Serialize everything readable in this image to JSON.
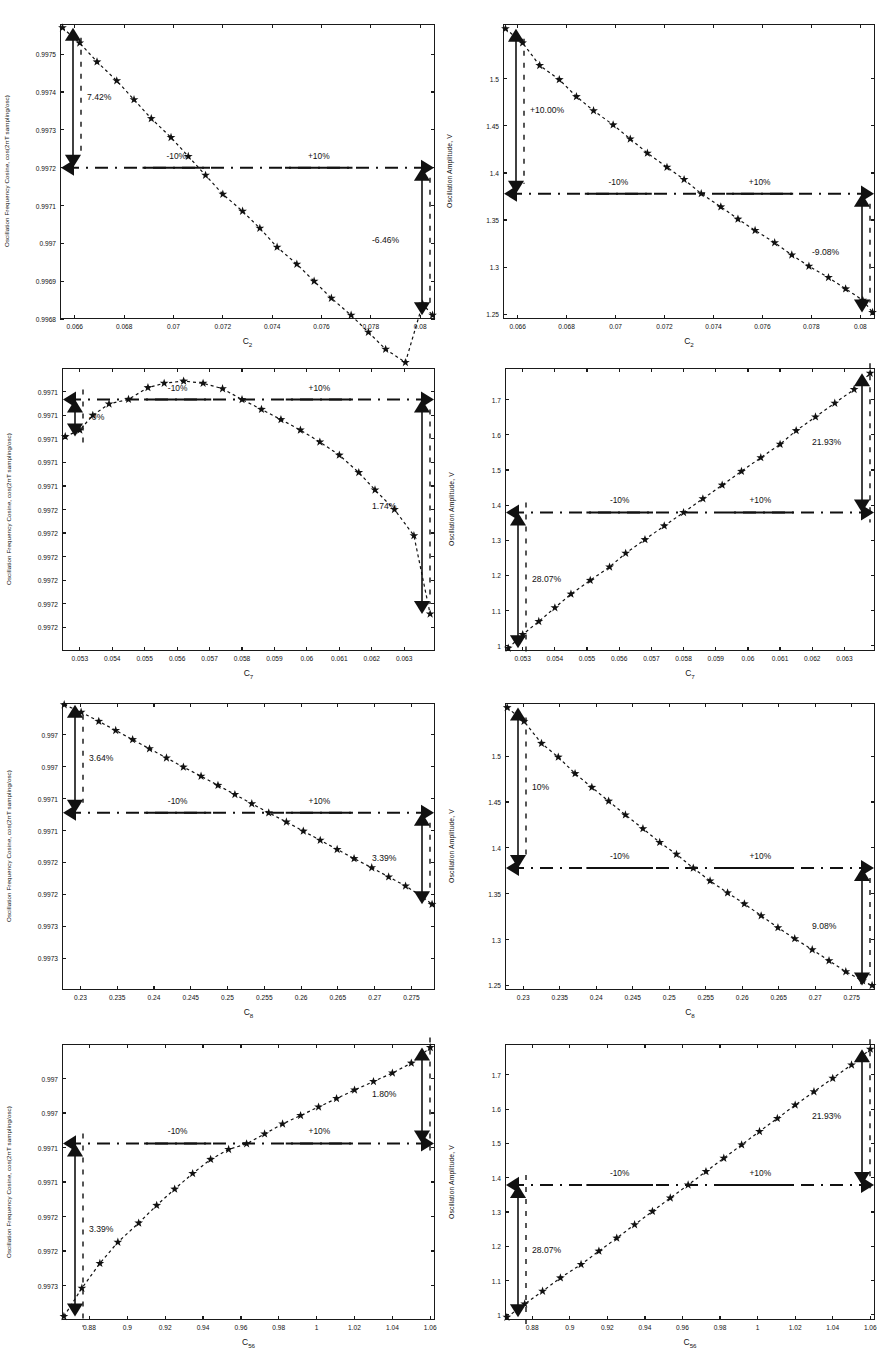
{
  "figure": {
    "columns": 2,
    "rows": 4,
    "marker": "star",
    "line_style": "dashed",
    "reference_line_style": "dash-dot",
    "colors": {
      "ink": "#111111",
      "frame": "#1a1a1a",
      "background": "#ffffff"
    },
    "common_band_labels": {
      "left": "-10%",
      "right": "+10%"
    }
  },
  "chart_data": [
    {
      "id": "p1",
      "type": "scatter",
      "title": "",
      "xlabel": "C2",
      "xlabel_sub": "2",
      "xlabel_base": "C",
      "ylabel": "Oscillation Frequency Cosine, cos(2πT sampling/osc)",
      "xlim": [
        0.0654,
        0.0806
      ],
      "ylim": [
        0.9968,
        0.99758
      ],
      "xticks": [
        0.066,
        0.068,
        0.07,
        0.072,
        0.074,
        0.076,
        0.078,
        0.08
      ],
      "xticklabels": [
        "0.066",
        "0.068",
        "0.07",
        "0.072",
        "0.074",
        "0.076",
        "0.078",
        "0.08"
      ],
      "yticks": [
        0.9968,
        0.9969,
        0.997,
        0.9971,
        0.9972,
        0.9973,
        0.9974,
        0.9975
      ],
      "yticklabels": [
        "0.9968",
        "0.9969",
        "0.997",
        "0.9971",
        "0.9972",
        "0.9973",
        "0.9974",
        "0.9975"
      ],
      "reference_y": 0.9972,
      "band_left_label": "-10%",
      "band_right_label": "+10%",
      "annotation_left": "7.42%",
      "annotation_right": "-6.46%",
      "x": [
        0.0655,
        0.0662,
        0.0669,
        0.0677,
        0.0684,
        0.0691,
        0.0699,
        0.0706,
        0.0713,
        0.072,
        0.0728,
        0.0735,
        0.0742,
        0.075,
        0.0757,
        0.0764,
        0.0772,
        0.0779,
        0.0786,
        0.0794,
        0.0801,
        0.0805
      ],
      "y": [
        0.99757,
        0.99753,
        0.99748,
        0.99743,
        0.99738,
        0.99733,
        0.99728,
        0.99723,
        0.99718,
        0.99713,
        0.997085,
        0.99704,
        0.99699,
        0.996945,
        0.9969,
        0.996855,
        0.99681,
        0.996765,
        0.99672,
        0.996685,
        0.99684,
        0.99681
      ]
    },
    {
      "id": "p2",
      "type": "scatter",
      "xlabel_base": "C",
      "xlabel_sub": "2",
      "ylabel": "Oscillation Amplitude, V",
      "xlim": [
        0.0654,
        0.0806
      ],
      "ylim": [
        1.245,
        1.558
      ],
      "xticks": [
        0.066,
        0.068,
        0.07,
        0.072,
        0.074,
        0.076,
        0.078,
        0.08
      ],
      "xticklabels": [
        "0.066",
        "0.068",
        "0.07",
        "0.072",
        "0.074",
        "0.076",
        "0.078",
        "0.08"
      ],
      "yticks": [
        1.25,
        1.3,
        1.35,
        1.4,
        1.45,
        1.5
      ],
      "yticklabels": [
        "1.25",
        "1.3",
        "1.35",
        "1.4",
        "1.45",
        "1.5"
      ],
      "reference_y": 1.378,
      "band_left_label": "-10%",
      "band_right_label": "+10%",
      "annotation_left": "+10.00%",
      "annotation_right": "-9.08%",
      "x": [
        0.0655,
        0.0662,
        0.0669,
        0.0677,
        0.0684,
        0.0691,
        0.0699,
        0.0706,
        0.0713,
        0.0721,
        0.0728,
        0.0735,
        0.0743,
        0.075,
        0.0757,
        0.0765,
        0.0772,
        0.0779,
        0.0787,
        0.0794,
        0.0801,
        0.0805
      ],
      "y": [
        1.553,
        1.538,
        1.514,
        1.499,
        1.481,
        1.466,
        1.451,
        1.436,
        1.421,
        1.406,
        1.393,
        1.378,
        1.364,
        1.351,
        1.339,
        1.326,
        1.313,
        1.301,
        1.289,
        1.277,
        1.265,
        1.252
      ]
    },
    {
      "id": "p3",
      "type": "scatter",
      "xlabel_base": "C",
      "xlabel_sub": "7",
      "ylabel": "Oscillation Frequency Cosine, cos(2πT sampling/osc)",
      "xlim": [
        0.05245,
        0.06395
      ],
      "ylim": [
        0.997095,
        0.997225
      ],
      "xticks": [
        0.053,
        0.054,
        0.055,
        0.056,
        0.057,
        0.058,
        0.059,
        0.06,
        0.061,
        0.062,
        0.063
      ],
      "xticklabels": [
        "0.053",
        "0.054",
        "0.055",
        "0.056",
        "0.057",
        "0.058",
        "0.059",
        "0.06",
        "0.061",
        "0.062",
        "0.063"
      ],
      "yticklabels": [
        "0.9972",
        "0.9972",
        "0.9972",
        "0.9972",
        "0.9972",
        "0.9972",
        "0.9971",
        "0.9971",
        "0.9971",
        "0.9971",
        "0.9971"
      ],
      "reference_y": 0.9972105,
      "band_left_label": "-10%",
      "band_right_label": "+10%",
      "annotation_left": "-0%",
      "annotation_right": "1.74%",
      "x": [
        0.05255,
        0.053,
        0.0534,
        0.0539,
        0.0545,
        0.0551,
        0.0556,
        0.0562,
        0.0568,
        0.0574,
        0.058,
        0.0586,
        0.0592,
        0.0598,
        0.0604,
        0.061,
        0.0616,
        0.0621,
        0.0627,
        0.0633,
        0.0638
      ],
      "y": [
        0.9971935,
        0.9971965,
        0.9972033,
        0.9972085,
        0.9972106,
        0.997216,
        0.997218,
        0.997219,
        0.997218,
        0.9972155,
        0.9972105,
        0.997206,
        0.9972013,
        0.9971965,
        0.997191,
        0.997185,
        0.997177,
        0.997169,
        0.99716,
        0.997148,
        0.997112
      ]
    },
    {
      "id": "p4",
      "type": "scatter",
      "xlabel_base": "C",
      "xlabel_sub": "7",
      "ylabel": "Oscillation Amplitude, V",
      "xlim": [
        0.05245,
        0.06395
      ],
      "ylim": [
        0.985,
        1.79
      ],
      "xticks": [
        0.053,
        0.054,
        0.055,
        0.056,
        0.057,
        0.058,
        0.059,
        0.06,
        0.061,
        0.062,
        0.063
      ],
      "xticklabels": [
        "0.053",
        "0.054",
        "0.055",
        "0.056",
        "0.057",
        "0.058",
        "0.059",
        "0.06",
        "0.061",
        "0.062",
        "0.063"
      ],
      "yticks": [
        1,
        1.1,
        1.2,
        1.3,
        1.4,
        1.5,
        1.6,
        1.7
      ],
      "yticklabels": [
        "1",
        "1.1",
        "1.2",
        "1.3",
        "1.4",
        "1.5",
        "1.6",
        "1.7"
      ],
      "reference_y": 1.379,
      "band_left_label": "-10%",
      "band_right_label": "+10%",
      "annotation_left": "28.07%",
      "annotation_right": "21.93%",
      "x": [
        0.05255,
        0.053,
        0.0535,
        0.054,
        0.0545,
        0.0551,
        0.0557,
        0.0562,
        0.0568,
        0.0574,
        0.058,
        0.0586,
        0.0592,
        0.0598,
        0.0604,
        0.061,
        0.0615,
        0.0621,
        0.0627,
        0.0633,
        0.0638
      ],
      "y": [
        0.993,
        1.032,
        1.069,
        1.108,
        1.147,
        1.186,
        1.224,
        1.263,
        1.302,
        1.341,
        1.379,
        1.418,
        1.457,
        1.496,
        1.535,
        1.573,
        1.612,
        1.651,
        1.69,
        1.729,
        1.775
      ]
    },
    {
      "id": "p5",
      "type": "scatter",
      "xlabel_base": "C",
      "xlabel_sub": "8",
      "ylabel": "Oscillation Frequency Cosine, cos(2πT sampling/osc)",
      "xlim": [
        0.2275,
        0.2782
      ],
      "ylim": [
        0.99699,
        0.997335
      ],
      "xticks": [
        0.23,
        0.235,
        0.24,
        0.245,
        0.25,
        0.255,
        0.26,
        0.265,
        0.27,
        0.275
      ],
      "xticklabels": [
        "0.23",
        "0.235",
        "0.24",
        "0.245",
        "0.25",
        "0.255",
        "0.26",
        "0.265",
        "0.27",
        "0.275"
      ],
      "yticklabels": [
        "0.9973",
        "0.9973",
        "0.9972",
        "0.9972",
        "0.9971",
        "0.9971",
        "0.997",
        "0.997"
      ],
      "reference_y": 0.997203,
      "band_left_label": "-10%",
      "band_right_label": "+10%",
      "annotation_left": "3.64%",
      "annotation_right": "3.39%",
      "x": [
        0.2278,
        0.2301,
        0.2325,
        0.2348,
        0.2371,
        0.2394,
        0.2417,
        0.244,
        0.2464,
        0.2487,
        0.251,
        0.2533,
        0.2556,
        0.258,
        0.2603,
        0.2626,
        0.2649,
        0.2672,
        0.2696,
        0.2719,
        0.2742,
        0.2765,
        0.2778
      ],
      "y": [
        0.997333,
        0.997324,
        0.997313,
        0.997302,
        0.997291,
        0.99728,
        0.997269,
        0.997258,
        0.997247,
        0.997236,
        0.997225,
        0.997214,
        0.997203,
        0.997192,
        0.997181,
        0.99717,
        0.997159,
        0.997148,
        0.997137,
        0.997126,
        0.997115,
        0.997102,
        0.997093
      ]
    },
    {
      "id": "p6",
      "type": "scatter",
      "xlabel_base": "C",
      "xlabel_sub": "8",
      "ylabel": "Oscillation Amplitude, V",
      "xlim": [
        0.2275,
        0.2782
      ],
      "ylim": [
        1.245,
        1.558
      ],
      "xticks": [
        0.23,
        0.235,
        0.24,
        0.245,
        0.25,
        0.255,
        0.26,
        0.265,
        0.27,
        0.275
      ],
      "xticklabels": [
        "0.23",
        "0.235",
        "0.24",
        "0.245",
        "0.25",
        "0.255",
        "0.26",
        "0.265",
        "0.27",
        "0.275"
      ],
      "yticks": [
        1.25,
        1.3,
        1.35,
        1.4,
        1.45,
        1.5
      ],
      "yticklabels": [
        "1.25",
        "1.3",
        "1.35",
        "1.4",
        "1.45",
        "1.5"
      ],
      "reference_y": 1.378,
      "band_left_label": "-10%",
      "band_right_label": "+10%",
      "annotation_left": "10%",
      "annotation_right": "9.08%",
      "x": [
        0.2278,
        0.2301,
        0.2325,
        0.2348,
        0.2371,
        0.2394,
        0.2417,
        0.244,
        0.2464,
        0.2487,
        0.251,
        0.2533,
        0.2556,
        0.258,
        0.2603,
        0.2626,
        0.2649,
        0.2672,
        0.2696,
        0.2719,
        0.2742,
        0.2765,
        0.2778
      ],
      "y": [
        1.553,
        1.538,
        1.514,
        1.499,
        1.481,
        1.466,
        1.451,
        1.436,
        1.421,
        1.406,
        1.393,
        1.378,
        1.364,
        1.351,
        1.339,
        1.326,
        1.313,
        1.301,
        1.289,
        1.277,
        1.265,
        1.255,
        1.25
      ]
    },
    {
      "id": "p7",
      "type": "scatter",
      "xlabel_base": "C",
      "xlabel_sub": "56",
      "ylabel": "Oscillation Frequency Cosine, cos(2πT sampling/osc)",
      "xlim": [
        0.8655,
        1.0625
      ],
      "ylim": [
        0.996955,
        0.997345
      ],
      "xticks": [
        0.88,
        0.9,
        0.92,
        0.94,
        0.96,
        0.98,
        1,
        1.02,
        1.04,
        1.06
      ],
      "xticklabels": [
        "0.88",
        "0.9",
        "0.92",
        "0.94",
        "0.96",
        "0.98",
        "1",
        "1.02",
        "1.04",
        "1.06"
      ],
      "yticklabels": [
        "0.9973",
        "0.9972",
        "0.9972",
        "0.9971",
        "0.9971",
        "0.997",
        "0.997"
      ],
      "reference_y": 0.9972045,
      "band_left_label": "-10%",
      "band_right_label": "+10%",
      "annotation_left": "3.39%",
      "annotation_right": "1.80%",
      "x": [
        0.8665,
        0.876,
        0.8855,
        0.895,
        0.906,
        0.9155,
        0.925,
        0.9345,
        0.944,
        0.9535,
        0.963,
        0.9725,
        0.982,
        0.9915,
        1.001,
        1.0105,
        1.02,
        1.03,
        1.04,
        1.05,
        1.06
      ],
      "y": [
        0.99696,
        0.997,
        0.997035,
        0.997065,
        0.997092,
        0.997117,
        0.99714,
        0.997162,
        0.997182,
        0.997196,
        0.997204,
        0.997218,
        0.997232,
        0.997244,
        0.997256,
        0.997268,
        0.99728,
        0.997292,
        0.997304,
        0.997318,
        0.99734
      ]
    },
    {
      "id": "p8",
      "type": "scatter",
      "xlabel_base": "C",
      "xlabel_sub": "56",
      "ylabel": "Oscillation Amplitude, V",
      "xlim": [
        0.8655,
        1.0625
      ],
      "ylim": [
        0.985,
        1.79
      ],
      "xticks": [
        0.88,
        0.9,
        0.92,
        0.94,
        0.96,
        0.98,
        1,
        1.02,
        1.04,
        1.06
      ],
      "xticklabels": [
        "0.88",
        "0.9",
        "0.92",
        "0.94",
        "0.96",
        "0.98",
        "1",
        "1.02",
        "1.04",
        "1.06"
      ],
      "yticks": [
        1,
        1.1,
        1.2,
        1.3,
        1.4,
        1.5,
        1.6,
        1.7
      ],
      "yticklabels": [
        "1",
        "1.1",
        "1.2",
        "1.3",
        "1.4",
        "1.5",
        "1.6",
        "1.7"
      ],
      "reference_y": 1.379,
      "band_left_label": "-10%",
      "band_right_label": "+10%",
      "annotation_left": "28.07%",
      "annotation_right": "21.93%",
      "x": [
        0.8665,
        0.876,
        0.8855,
        0.895,
        0.906,
        0.9155,
        0.925,
        0.9345,
        0.944,
        0.9535,
        0.963,
        0.9725,
        0.982,
        0.9915,
        1.001,
        1.0105,
        1.02,
        1.03,
        1.04,
        1.05,
        1.06
      ],
      "y": [
        0.993,
        1.032,
        1.069,
        1.108,
        1.147,
        1.186,
        1.224,
        1.263,
        1.302,
        1.341,
        1.379,
        1.418,
        1.457,
        1.496,
        1.535,
        1.573,
        1.612,
        1.651,
        1.69,
        1.729,
        1.775
      ]
    }
  ]
}
